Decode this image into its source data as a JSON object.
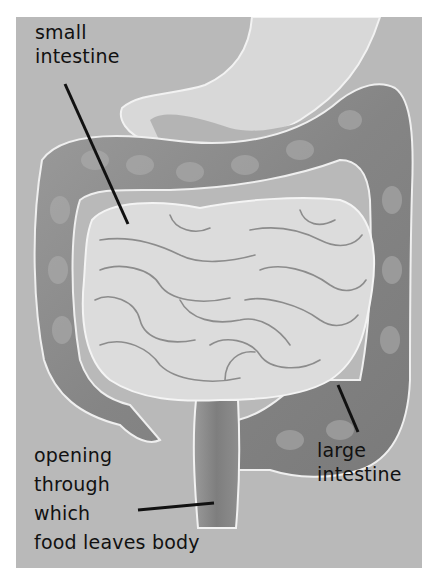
{
  "figure": {
    "type": "anatomical-diagram",
    "background_color": "#b9b9b9",
    "organ_light_color": "#dcdcdc",
    "organ_dark_color": "#8a8a8a"
  },
  "labels": {
    "small_intestine": {
      "lines": [
        "small",
        "intestine"
      ]
    },
    "large_intestine": {
      "lines": [
        "large",
        "intestine"
      ]
    },
    "opening": {
      "lines": [
        "opening",
        "through",
        "which",
        "food leaves body"
      ]
    }
  }
}
